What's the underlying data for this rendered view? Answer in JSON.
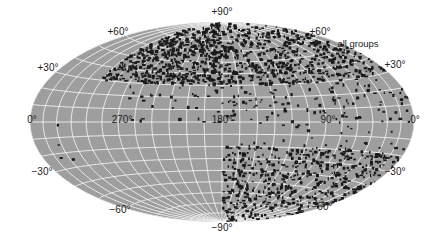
{
  "figure": {
    "title": "all groups",
    "projection": "equal-area all-sky (Aitoff-type)",
    "colors": {
      "background": "#ffffff",
      "sky_fill": "#9e9e9e",
      "grid": "#f2f2f2",
      "points": "#1a1a1a",
      "text": "#222222"
    }
  },
  "labels": {
    "lat_p90": "+90°",
    "lat_p60_left": "+60°",
    "lat_p60_right": "+60°",
    "lat_p30_left": "+30°",
    "lat_p30_right": "+30°",
    "lon_0_left": "0°",
    "lon_270": "270°",
    "lon_180": "180°",
    "lon_90": "90°",
    "lon_0_right": "0°",
    "lat_m30_left": "−30°",
    "lat_m30_right": "−30°",
    "lat_m60_left": "−60°",
    "lat_m60_right": "−60°",
    "lat_m90": "−90°"
  },
  "chart_data": {
    "type": "scatter",
    "title": "all groups",
    "xlabel": "longitude",
    "ylabel": "latitude",
    "x_ticks": [
      "0°",
      "270°",
      "180°",
      "90°",
      "0°"
    ],
    "y_ticks": [
      "+90°",
      "+60°",
      "+30°",
      "0°",
      "−30°",
      "−60°",
      "−90°"
    ],
    "xlim": [
      360,
      0
    ],
    "ylim": [
      -90,
      90
    ],
    "grid": true,
    "grid_spacing_deg": {
      "lon": 15,
      "lat": 10
    },
    "density_regions": [
      {
        "lon_range": [
          0,
          180
        ],
        "lat_range": [
          30,
          90
        ],
        "density": "high"
      },
      {
        "lon_range": [
          180,
          300
        ],
        "lat_range": [
          30,
          90
        ],
        "density": "high"
      },
      {
        "lon_range": [
          0,
          180
        ],
        "lat_range": [
          0,
          30
        ],
        "density": "medium"
      },
      {
        "lon_range": [
          180,
          270
        ],
        "lat_range": [
          0,
          30
        ],
        "density": "low"
      },
      {
        "lon_range": [
          0,
          180
        ],
        "lat_range": [
          -90,
          -20
        ],
        "density": "high"
      },
      {
        "lon_range": [
          0,
          180
        ],
        "lat_range": [
          -20,
          0
        ],
        "density": "low"
      },
      {
        "lon_range": [
          180,
          360
        ],
        "lat_range": [
          -90,
          0
        ],
        "density": "very low"
      }
    ]
  }
}
